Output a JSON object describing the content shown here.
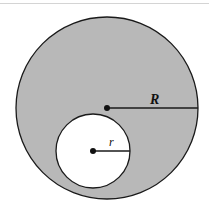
{
  "diagram": {
    "type": "annulus-offset-circles",
    "outer_circle": {
      "label": "R",
      "center": [
        107,
        108
      ],
      "radius": 91,
      "fill": "#b8b8b8",
      "stroke": "#1a1a1a"
    },
    "inner_circle": {
      "label": "r",
      "center": [
        93,
        151
      ],
      "radius": 37,
      "fill": "#ffffff",
      "stroke": "#1a1a1a"
    }
  }
}
